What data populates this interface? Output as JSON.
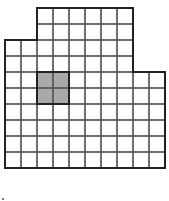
{
  "diagram": {
    "type": "grid-polygon",
    "cell_size_px": 16,
    "origin_px": [
      5,
      8
    ],
    "columns": 10,
    "rows": 10,
    "row_spans": [
      {
        "rows": [
          0,
          1
        ],
        "col_start": 2,
        "col_end": 8
      },
      {
        "rows": [
          2,
          3
        ],
        "col_start": 0,
        "col_end": 8
      },
      {
        "rows": [
          4,
          5,
          6,
          7,
          8,
          9
        ],
        "col_start": 0,
        "col_end": 10
      }
    ],
    "shaded_region": {
      "col_start": 2,
      "col_end": 4,
      "row_start": 4,
      "row_end": 6
    },
    "total_unit_squares": 88,
    "shaded_unit_squares": 4,
    "colors": {
      "background": "#ffffff",
      "grid_line": "#555555",
      "outline": "#222222",
      "shaded_fill": "#a9a9a9"
    }
  }
}
